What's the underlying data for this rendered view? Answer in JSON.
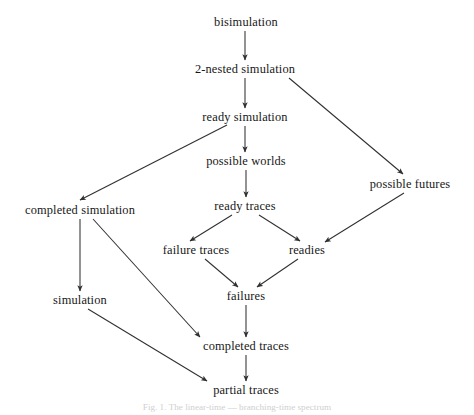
{
  "figure": {
    "caption": "Fig. 1. The linear-time — branching-time spectrum",
    "background_color": "#ffffff",
    "edge_color": "#303030",
    "text_color": "#171717",
    "width": 474,
    "height": 415
  },
  "chart_data": {
    "type": "diagram",
    "title": "The linear-time — branching-time spectrum",
    "layout": "directed acyclic graph, top-to-bottom hierarchy",
    "nodes": [
      {
        "id": "bisimulation",
        "label": "bisimulation",
        "x": 246,
        "y": 22
      },
      {
        "id": "two_nested_simulation",
        "label": "2-nested simulation",
        "x": 245,
        "y": 69
      },
      {
        "id": "ready_simulation",
        "label": "ready simulation",
        "x": 245,
        "y": 117
      },
      {
        "id": "possible_worlds",
        "label": "possible worlds",
        "x": 246,
        "y": 161
      },
      {
        "id": "possible_futures",
        "label": "possible futures",
        "x": 410,
        "y": 184
      },
      {
        "id": "completed_simulation",
        "label": "completed simulation",
        "x": 80,
        "y": 210
      },
      {
        "id": "ready_traces",
        "label": "ready traces",
        "x": 245,
        "y": 206
      },
      {
        "id": "failure_traces",
        "label": "failure traces",
        "x": 196,
        "y": 250
      },
      {
        "id": "readies",
        "label": "readies",
        "x": 307,
        "y": 250
      },
      {
        "id": "simulation",
        "label": "simulation",
        "x": 80,
        "y": 300
      },
      {
        "id": "failures",
        "label": "failures",
        "x": 246,
        "y": 296
      },
      {
        "id": "completed_traces",
        "label": "completed traces",
        "x": 246,
        "y": 346
      },
      {
        "id": "partial_traces",
        "label": "partial traces",
        "x": 246,
        "y": 390
      }
    ],
    "edges": [
      {
        "from": "bisimulation",
        "to": "two_nested_simulation",
        "x1": 245,
        "y1": 31,
        "x2": 245,
        "y2": 60
      },
      {
        "from": "two_nested_simulation",
        "to": "ready_simulation",
        "x1": 245,
        "y1": 78,
        "x2": 245,
        "y2": 108
      },
      {
        "from": "two_nested_simulation",
        "to": "possible_futures",
        "x1": 289,
        "y1": 78,
        "x2": 403,
        "y2": 174
      },
      {
        "from": "ready_simulation",
        "to": "possible_worlds",
        "x1": 245,
        "y1": 126,
        "x2": 245,
        "y2": 152
      },
      {
        "from": "ready_simulation",
        "to": "completed_simulation",
        "x1": 227,
        "y1": 125,
        "x2": 80,
        "y2": 200
      },
      {
        "from": "possible_worlds",
        "to": "ready_traces",
        "x1": 246,
        "y1": 170,
        "x2": 246,
        "y2": 197
      },
      {
        "from": "possible_futures",
        "to": "readies",
        "x1": 404,
        "y1": 193,
        "x2": 325,
        "y2": 242
      },
      {
        "from": "ready_traces",
        "to": "failure_traces",
        "x1": 232,
        "y1": 215,
        "x2": 190,
        "y2": 241
      },
      {
        "from": "ready_traces",
        "to": "readies",
        "x1": 259,
        "y1": 215,
        "x2": 300,
        "y2": 241
      },
      {
        "from": "completed_simulation",
        "to": "simulation",
        "x1": 80,
        "y1": 219,
        "x2": 80,
        "y2": 291
      },
      {
        "from": "completed_simulation",
        "to": "completed_traces",
        "x1": 93,
        "y1": 219,
        "x2": 200,
        "y2": 337
      },
      {
        "from": "failure_traces",
        "to": "failures",
        "x1": 205,
        "y1": 259,
        "x2": 238,
        "y2": 287
      },
      {
        "from": "readies",
        "to": "failures",
        "x1": 298,
        "y1": 259,
        "x2": 257,
        "y2": 287
      },
      {
        "from": "failures",
        "to": "completed_traces",
        "x1": 246,
        "y1": 305,
        "x2": 246,
        "y2": 337
      },
      {
        "from": "simulation",
        "to": "partial_traces",
        "x1": 88,
        "y1": 309,
        "x2": 207,
        "y2": 381
      },
      {
        "from": "completed_traces",
        "to": "partial_traces",
        "x1": 246,
        "y1": 355,
        "x2": 246,
        "y2": 381
      }
    ]
  }
}
